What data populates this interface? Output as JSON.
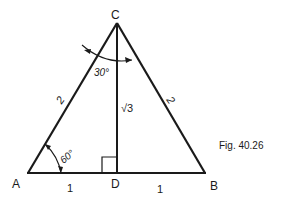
{
  "figure": {
    "caption": "Fig. 40.26",
    "vertices": {
      "A": {
        "label": "A",
        "x": 28,
        "y": 173
      },
      "B": {
        "label": "B",
        "x": 205,
        "y": 173
      },
      "C": {
        "label": "C",
        "x": 117,
        "y": 23
      },
      "D": {
        "label": "D",
        "x": 117,
        "y": 173
      }
    },
    "side_labels": {
      "AC": "2",
      "BC": "2",
      "CD": "√3",
      "AD": "1",
      "DB": "1"
    },
    "angle_labels": {
      "A": "60°",
      "C": "30°"
    },
    "colors": {
      "stroke": "#1a1a1a",
      "background": "#ffffff"
    }
  }
}
